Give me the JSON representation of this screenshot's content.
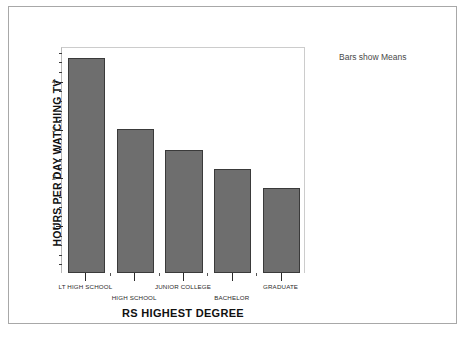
{
  "chart_data": {
    "type": "bar",
    "title": "",
    "xlabel": "RS HIGHEST DEGREE",
    "ylabel": "HOURS PER DAY WATCHING TV",
    "categories": [
      "LT HIGH SCHOOL",
      "HIGH SCHOOL",
      "JUNIOR COLLEGE",
      "BACHELOR",
      "GRADUATE"
    ],
    "values": [
      4.47,
      3.0,
      2.56,
      2.17,
      1.77
    ],
    "ylim": [
      0,
      4.7
    ],
    "ytick_labels": [
      "1",
      "2",
      "3",
      "4"
    ],
    "ytick_values": [
      1,
      2,
      3,
      4
    ],
    "minor_tick_step": 0.2,
    "grid": false,
    "annotation": "Bars show Means",
    "bar_fill_color": "#6e6e6e",
    "bar_edge_color": "#3a3a3a",
    "frame_color": "#a8a8a8"
  }
}
